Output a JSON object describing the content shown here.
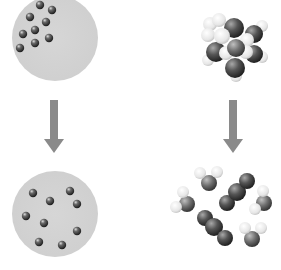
{
  "diagram": {
    "colors": {
      "background": "#ffffff",
      "circle_fill": "#d3d3d3",
      "arrow": "#8a8a8a",
      "atom_dark": "#3a3a3a",
      "atom_mid": "#6e6e6e",
      "atom_light": "#f0f0f0"
    },
    "left_column": {
      "before": {
        "label": "",
        "container": {
          "cx": 55,
          "cy": 38,
          "r": 43
        },
        "atoms": [
          {
            "x": 40,
            "y": 5
          },
          {
            "x": 52,
            "y": 10
          },
          {
            "x": 30,
            "y": 17
          },
          {
            "x": 46,
            "y": 22
          },
          {
            "x": 35,
            "y": 30
          },
          {
            "x": 23,
            "y": 34
          },
          {
            "x": 49,
            "y": 38
          },
          {
            "x": 35,
            "y": 43
          },
          {
            "x": 20,
            "y": 48
          }
        ]
      },
      "arrow": {
        "x": 54,
        "y1": 100,
        "y2": 153
      },
      "after": {
        "label": "",
        "container": {
          "cx": 55,
          "cy": 214,
          "r": 43
        },
        "atoms": [
          {
            "x": 33,
            "y": 193
          },
          {
            "x": 70,
            "y": 191
          },
          {
            "x": 50,
            "y": 201
          },
          {
            "x": 77,
            "y": 204
          },
          {
            "x": 26,
            "y": 216
          },
          {
            "x": 44,
            "y": 223
          },
          {
            "x": 77,
            "y": 231
          },
          {
            "x": 39,
            "y": 242
          },
          {
            "x": 62,
            "y": 245
          }
        ]
      }
    },
    "right_column": {
      "before": {
        "label": "",
        "cluster_center": {
          "x": 233,
          "y": 45
        }
      },
      "arrow": {
        "x": 233,
        "y1": 100,
        "y2": 153
      },
      "after": {
        "label": "",
        "bent_molecules": [
          {
            "x": 209,
            "y": 181
          },
          {
            "x": 185,
            "y": 203
          },
          {
            "x": 265,
            "y": 203
          },
          {
            "x": 253,
            "y": 236
          }
        ],
        "linear_molecules": [
          {
            "x": 237,
            "y": 192,
            "angle": -40
          },
          {
            "x": 222,
            "y": 228,
            "angle": 40
          }
        ]
      }
    }
  }
}
